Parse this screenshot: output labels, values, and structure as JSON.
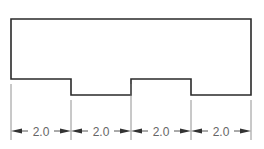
{
  "diagram": {
    "type": "technical-drawing",
    "colors": {
      "outline": "#2a2a2a",
      "dimension": "#555555",
      "text": "#666666"
    },
    "profile": {
      "points": [
        [
          11,
          19
        ],
        [
          251,
          19
        ],
        [
          251,
          95
        ],
        [
          191,
          95
        ],
        [
          191,
          79
        ],
        [
          131,
          79
        ],
        [
          131,
          95
        ],
        [
          71,
          95
        ],
        [
          71,
          79
        ],
        [
          11,
          79
        ]
      ]
    },
    "dimension_line_y": 131,
    "extension_lines_x": [
      11,
      71,
      131,
      191,
      251
    ],
    "dimensions": [
      {
        "label": "2.0",
        "x1": 11,
        "x2": 71
      },
      {
        "label": "2.0",
        "x1": 71,
        "x2": 131
      },
      {
        "label": "2.0",
        "x1": 131,
        "x2": 191
      },
      {
        "label": "2.0",
        "x1": 191,
        "x2": 251
      }
    ]
  }
}
